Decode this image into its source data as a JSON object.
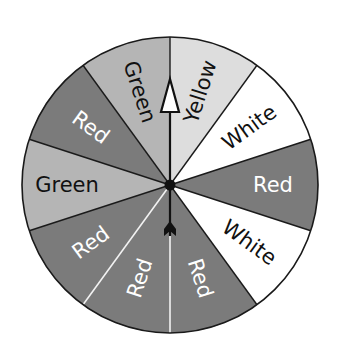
{
  "spinner": {
    "center": [
      170,
      185
    ],
    "radius": 148,
    "section_count": 10,
    "colors": {
      "Red": "#7b7b7b",
      "Green": "#b5b5b5",
      "Yellow": "#dddddd",
      "White": "#ffffff"
    },
    "text_colors": {
      "Red": "#ffffff",
      "Green": "#111111",
      "Yellow": "#111111",
      "White": "#111111"
    },
    "sections": [
      {
        "label": "Yellow",
        "start_deg": 0,
        "end_deg": 36
      },
      {
        "label": "White",
        "start_deg": 36,
        "end_deg": 72
      },
      {
        "label": "Red",
        "start_deg": 72,
        "end_deg": 108
      },
      {
        "label": "White",
        "start_deg": 108,
        "end_deg": 144
      },
      {
        "label": "Red",
        "start_deg": 144,
        "end_deg": 180
      },
      {
        "label": "Red",
        "start_deg": 180,
        "end_deg": 216
      },
      {
        "label": "Red",
        "start_deg": 216,
        "end_deg": 252
      },
      {
        "label": "Green",
        "start_deg": 252,
        "end_deg": 288
      },
      {
        "label": "Red",
        "start_deg": 288,
        "end_deg": 324
      },
      {
        "label": "Green",
        "start_deg": 324,
        "end_deg": 360
      }
    ],
    "pointer": {
      "direction_deg": 0,
      "description": "arrow pointing up along Green/Yellow boundary"
    }
  }
}
